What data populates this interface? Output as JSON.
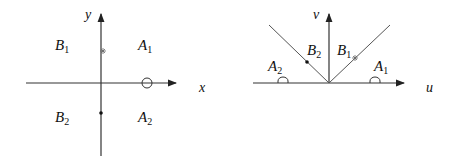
{
  "left_diagram": {
    "x_axis_label": "x",
    "y_axis_label": "y",
    "regions": [
      {
        "name": "B",
        "sub": "1"
      },
      {
        "name": "A",
        "sub": "1"
      },
      {
        "name": "B",
        "sub": "2"
      },
      {
        "name": "A",
        "sub": "2"
      }
    ],
    "markers": [
      "star",
      "circle",
      "dot"
    ]
  },
  "right_diagram": {
    "u_axis_label": "u",
    "v_axis_label": "v",
    "regions": [
      {
        "name": "B",
        "sub": "2"
      },
      {
        "name": "B",
        "sub": "1"
      },
      {
        "name": "A",
        "sub": "2"
      },
      {
        "name": "A",
        "sub": "1"
      }
    ],
    "markers": [
      "dot",
      "star",
      "semicircle-left",
      "semicircle-right"
    ]
  }
}
